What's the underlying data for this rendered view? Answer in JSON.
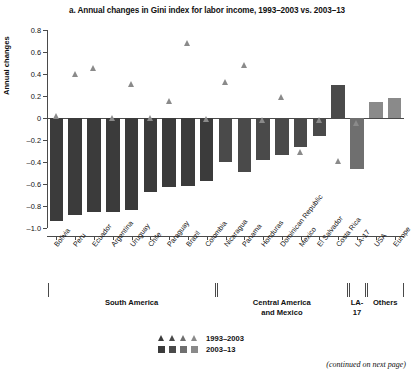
{
  "chart_data": {
    "type": "bar",
    "title": "a. Annual changes in Gini index for labor income, 1993–2003 vs. 2003–13",
    "xlabel": "",
    "ylabel": "Annual changes",
    "ylim": [
      -1.0,
      0.8
    ],
    "yticks": [
      0.8,
      0.6,
      0.4,
      0.2,
      0,
      -0.2,
      -0.4,
      -0.6,
      -0.8,
      -1.0
    ],
    "ytick_labels": [
      "0.8",
      "0.6",
      "0.4",
      "0.2",
      "0",
      "–0.2",
      "–0.4",
      "–0.6",
      "–0.8",
      "–1.0"
    ],
    "grid": false,
    "legend_position": "bottom",
    "categories": [
      "Bolivia",
      "Peru",
      "Ecuador",
      "Argentina",
      "Uruguay",
      "Chile",
      "Paraguay",
      "Brazil",
      "Colombia",
      "Nicaragua",
      "Panama",
      "Honduras",
      "Dominican Republic",
      "Mexico",
      "El Salvador",
      "Costa Rica",
      "LA-17",
      "USA",
      "Europe"
    ],
    "series": [
      {
        "name": "1993–2003",
        "marker": "triangle",
        "values": [
          0.02,
          0.4,
          0.45,
          0.0,
          0.31,
          0.0,
          0.15,
          0.68,
          -0.01,
          0.33,
          0.48,
          -0.02,
          0.19,
          -0.31,
          -0.02,
          -0.39,
          -0.05,
          0.1,
          0.03
        ]
      },
      {
        "name": "2003–13",
        "marker": "bar",
        "values": [
          -0.94,
          -0.88,
          -0.85,
          -0.85,
          -0.84,
          -0.67,
          -0.63,
          -0.62,
          -0.57,
          -0.4,
          -0.49,
          -0.38,
          -0.34,
          -0.26,
          -0.16,
          0.3,
          -0.46,
          0.15,
          0.18
        ]
      }
    ],
    "groups": [
      {
        "label": "South America",
        "start": 0,
        "end": 8
      },
      {
        "label": "Central America\nand Mexico",
        "start": 9,
        "end": 15
      },
      {
        "label": "LA-17",
        "start": 16,
        "end": 16
      },
      {
        "label": "Others",
        "start": 17,
        "end": 18
      }
    ],
    "group_colors": [
      "#3b3b3b",
      "#4a4a4a",
      "#6f6f6f",
      "#8a8a8a"
    ],
    "marker_color": "#8a8a8a"
  },
  "legend": {
    "rows": [
      {
        "label": "1993–2003",
        "shape": "triangle"
      },
      {
        "label": "2003–13",
        "shape": "square"
      }
    ]
  },
  "footer": {
    "continued_note": "(continued on next page)"
  },
  "group_labels": {
    "south_america": "South America",
    "central_america_line1": "Central America",
    "central_america_line2": "and Mexico",
    "la17": "LA-17",
    "others": "Others"
  }
}
